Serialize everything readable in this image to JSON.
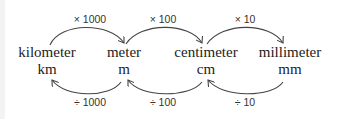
{
  "units": [
    {
      "name": "kilometer",
      "abbr": "km"
    },
    {
      "name": "meter",
      "abbr": "m"
    },
    {
      "name": "centimeter",
      "abbr": "cm"
    },
    {
      "name": "millimeter",
      "abbr": "mm"
    }
  ],
  "multiply_ops": [
    "× 1000",
    "× 100",
    "× 10"
  ],
  "divide_ops": [
    "÷ 1000",
    "÷ 100",
    "÷ 10"
  ],
  "colors": {
    "arrow": "#444444",
    "text": "#222222"
  }
}
